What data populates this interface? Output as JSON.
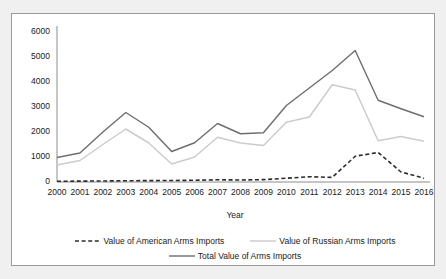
{
  "chart_data": {
    "type": "line",
    "title": "",
    "xlabel": "Year",
    "ylabel": "",
    "grid": false,
    "legend_position": "bottom",
    "xlim": [
      2000,
      2016
    ],
    "ylim": [
      0,
      6000
    ],
    "x": [
      2000,
      2001,
      2002,
      2003,
      2004,
      2005,
      2006,
      2007,
      2008,
      2009,
      2010,
      2011,
      2012,
      2013,
      2014,
      2015,
      2016
    ],
    "categories": [
      "2000",
      "2001",
      "2002",
      "2003",
      "2004",
      "2005",
      "2006",
      "2007",
      "2008",
      "2009",
      "2010",
      "2011",
      "2012",
      "2013",
      "2014",
      "2015",
      "2016"
    ],
    "y_ticks": [
      0,
      1000,
      2000,
      3000,
      4000,
      5000,
      6000
    ],
    "y_tick_labels": [
      "0",
      "1000",
      "2000",
      "3000",
      "4000",
      "5000",
      "6000"
    ],
    "series": [
      {
        "name": "Value of American Arms Imports",
        "style": "dashed",
        "color": "#2b2b2b",
        "values": [
          30,
          35,
          40,
          50,
          55,
          60,
          70,
          90,
          80,
          95,
          150,
          210,
          185,
          1030,
          1180,
          400,
          150
        ]
      },
      {
        "name": "Value of Russian Arms Imports",
        "style": "solid-light",
        "color": "#c8c8c8",
        "values": [
          680,
          860,
          1500,
          2120,
          1560,
          720,
          1000,
          1790,
          1560,
          1460,
          2390,
          2600,
          3890,
          3680,
          1650,
          1820,
          1630
        ]
      },
      {
        "name": "Total Value of Arms Imports",
        "style": "solid",
        "color": "#6b6b6b",
        "values": [
          980,
          1160,
          2000,
          2780,
          2190,
          1220,
          1570,
          2340,
          1930,
          1970,
          3060,
          3760,
          4460,
          5260,
          3270,
          2930,
          2610
        ]
      }
    ]
  },
  "legend": {
    "rows": [
      [
        {
          "label": "Value of American Arms Imports",
          "style": "dashed"
        },
        {
          "label": "Value of Russian Arms Imports",
          "style": "solid-light"
        }
      ],
      [
        {
          "label": "Total Value of Arms Imports",
          "style": "solid"
        }
      ]
    ]
  }
}
